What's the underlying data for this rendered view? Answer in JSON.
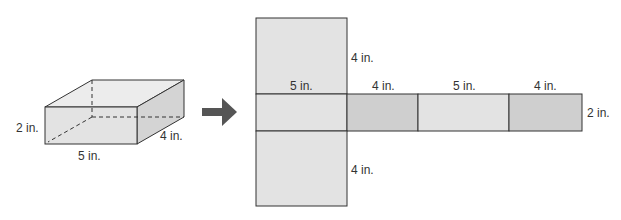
{
  "colors": {
    "face_light": "#e3e3e3",
    "face_dark": "#cfcfcf",
    "face_side": "#d6d6d6",
    "top_face": "#ececec",
    "stroke": "#333333",
    "arrow": "#555555"
  },
  "prism": {
    "label_height": "2 in.",
    "label_length": "5 in.",
    "label_width": "4 in."
  },
  "arrow": {
    "icon": "right-arrow-icon"
  },
  "net": {
    "top_face_side_label": "4 in.",
    "bottom_face_side_label": "4 in.",
    "strip_labels": [
      "5 in.",
      "4 in.",
      "5 in.",
      "4 in."
    ],
    "strip_height_label": "2 in."
  }
}
